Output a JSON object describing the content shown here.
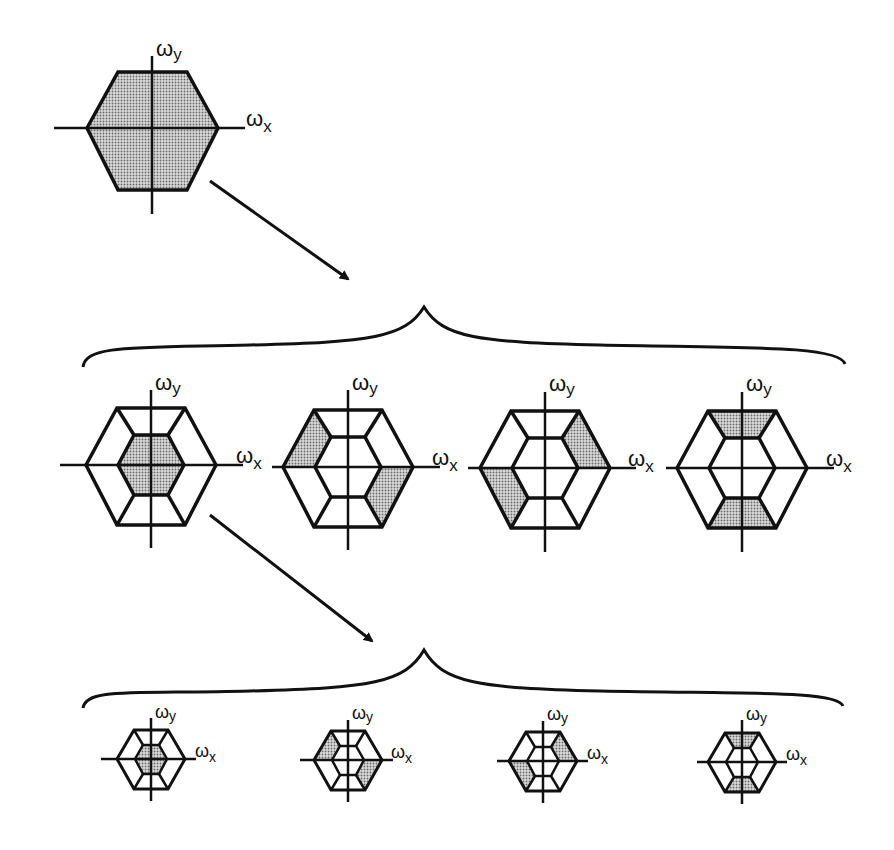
{
  "figure": {
    "axis_labels": {
      "x": "ωx",
      "y": "ωy",
      "x_symbol": "ω",
      "x_sub": "x",
      "y_symbol": "ω",
      "y_sub": "y"
    },
    "colors": {
      "line": "#111111",
      "fill_stipple": "#b8b8b8",
      "background": "#ffffff"
    },
    "levels": [
      {
        "name": "input-spectrum",
        "hexagons": [
          {
            "id": "full",
            "shaded": [
              "full"
            ],
            "scale": "large"
          }
        ]
      },
      {
        "name": "level-1",
        "hexagons": [
          {
            "id": "lowpass",
            "shaded": [
              "center"
            ],
            "scale": "large"
          },
          {
            "id": "band-diag-upleft-lowright",
            "shaded": [
              "upper-left",
              "lower-right"
            ],
            "scale": "large"
          },
          {
            "id": "band-diag-upright-lowleft",
            "shaded": [
              "upper-right",
              "lower-left"
            ],
            "scale": "large"
          },
          {
            "id": "band-vertical",
            "shaded": [
              "top",
              "bottom"
            ],
            "scale": "large"
          }
        ]
      },
      {
        "name": "level-2",
        "hexagons": [
          {
            "id": "lowpass",
            "shaded": [
              "center"
            ],
            "scale": "small"
          },
          {
            "id": "band-diag-upleft-lowright",
            "shaded": [
              "upper-left",
              "lower-right"
            ],
            "scale": "small"
          },
          {
            "id": "band-diag-upright-lowleft",
            "shaded": [
              "upper-right",
              "lower-left"
            ],
            "scale": "small"
          },
          {
            "id": "band-vertical",
            "shaded": [
              "top",
              "bottom"
            ],
            "scale": "small"
          }
        ]
      }
    ],
    "connectors": [
      {
        "type": "arrow",
        "from": "input-spectrum",
        "to": "level-1"
      },
      {
        "type": "brace",
        "group": "level-1"
      },
      {
        "type": "arrow",
        "from": "level-1.lowpass",
        "to": "level-2"
      },
      {
        "type": "brace",
        "group": "level-2"
      }
    ]
  }
}
